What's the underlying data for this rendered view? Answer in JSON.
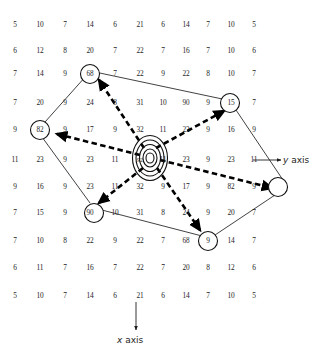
{
  "figure": {
    "type": "contour-node-diagram"
  },
  "axes": {
    "y": {
      "label": "y axis",
      "italic_part": "y",
      "text_part": "axis",
      "direction": "right",
      "arrow": "right-arrow-icon"
    },
    "x": {
      "label": "x axis",
      "italic_part": "x",
      "text_part": "axis",
      "direction": "down",
      "arrow": "down-arrow-icon"
    }
  },
  "grid": {
    "columns": 11,
    "rows": 11,
    "values": [
      [
        5,
        10,
        7,
        14,
        6,
        21,
        6,
        14,
        7,
        10,
        5
      ],
      [
        6,
        12,
        8,
        20,
        7,
        22,
        7,
        16,
        7,
        10,
        6
      ],
      [
        7,
        14,
        9,
        68,
        7,
        22,
        9,
        22,
        8,
        10,
        7
      ],
      [
        7,
        20,
        9,
        24,
        8,
        31,
        10,
        90,
        9,
        15,
        7
      ],
      [
        9,
        82,
        9,
        17,
        9,
        32,
        11,
        23,
        9,
        16,
        9
      ],
      [
        11,
        23,
        9,
        23,
        11,
        92,
        11,
        23,
        9,
        23,
        11
      ],
      [
        9,
        16,
        9,
        23,
        11,
        32,
        9,
        17,
        9,
        82,
        9
      ],
      [
        7,
        15,
        9,
        90,
        10,
        31,
        8,
        24,
        9,
        20,
        7
      ],
      [
        7,
        10,
        8,
        22,
        9,
        22,
        7,
        68,
        9,
        14,
        7
      ],
      [
        6,
        11,
        7,
        16,
        7,
        22,
        7,
        20,
        8,
        12,
        6
      ],
      [
        5,
        10,
        7,
        14,
        6,
        21,
        6,
        14,
        7,
        10,
        5
      ]
    ]
  },
  "nodes": [
    {
      "id": "node-top-left",
      "value": 68,
      "row": 2,
      "col": 3
    },
    {
      "id": "node-top-right",
      "value": 90,
      "row": 3,
      "col": 7
    },
    {
      "id": "node-left",
      "value": 82,
      "row": 4,
      "col": 1
    },
    {
      "id": "node-right",
      "value": 82,
      "row": 6,
      "col": 9
    },
    {
      "id": "node-bottom-left",
      "value": 90,
      "row": 7,
      "col": 3
    },
    {
      "id": "node-bottom-right",
      "value": 68,
      "row": 8,
      "col": 7
    }
  ],
  "center": {
    "id": "center-peak",
    "value": 92,
    "row": 5,
    "col": 5,
    "contour_rings": 5
  },
  "colors": {
    "background": "#ffffff",
    "text": "#1d1d1d",
    "line": "#111111",
    "dashed": "#000000"
  }
}
